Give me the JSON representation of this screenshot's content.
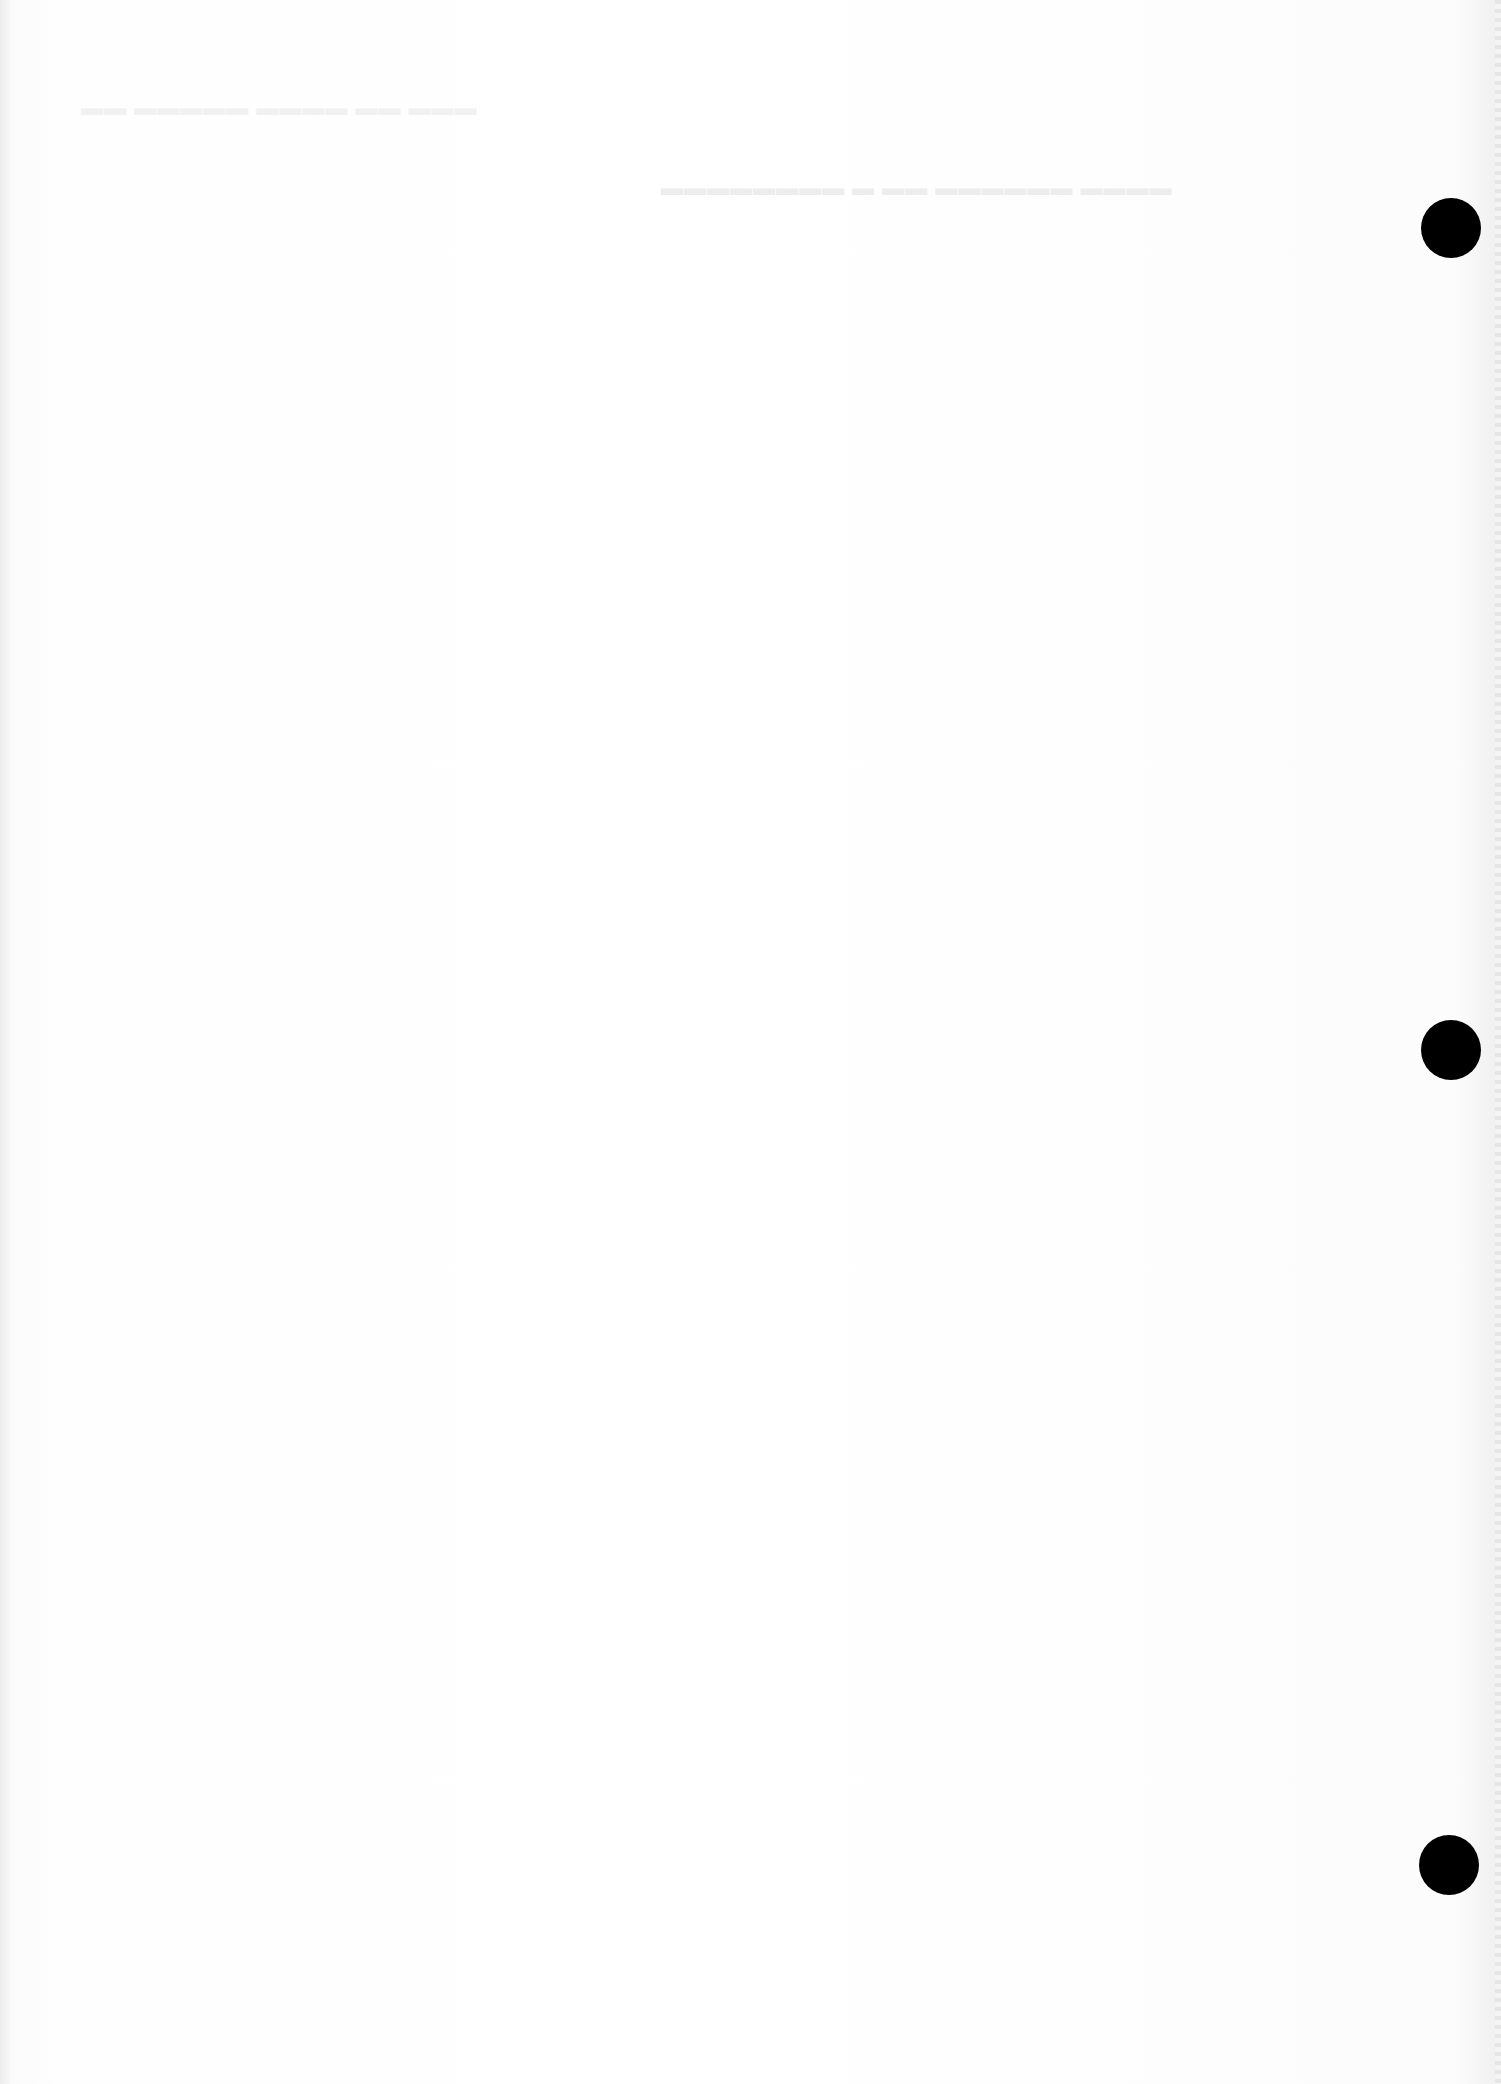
{
  "document": {
    "type": "blank hole-punched sheet",
    "background_color": "#ffffff",
    "visible_text": [],
    "hole_punches": [
      {
        "id": "top",
        "cx": 1451,
        "cy": 228,
        "r": 30,
        "color": "#000000"
      },
      {
        "id": "middle",
        "cx": 1451,
        "cy": 1050,
        "r": 30,
        "color": "#000000"
      },
      {
        "id": "bottom",
        "cx": 1449,
        "cy": 1865,
        "r": 30,
        "color": "#000000"
      }
    ]
  }
}
